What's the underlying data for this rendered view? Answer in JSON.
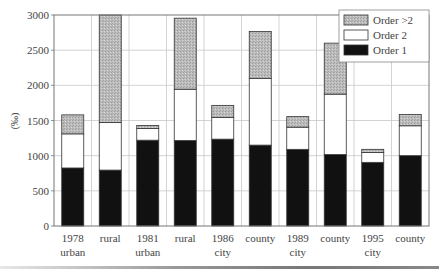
{
  "chart_data": {
    "type": "bar",
    "stacked": true,
    "title": "",
    "xlabel": "",
    "ylabel": "(‰)",
    "ylim": [
      0,
      3000
    ],
    "yticks": [
      0,
      500,
      1000,
      1500,
      2000,
      2500,
      3000
    ],
    "grid": true,
    "legend_position": "upper right (inside)",
    "categories": [
      {
        "line1": "1978",
        "line2": "urban"
      },
      {
        "line1": "rural",
        "line2": ""
      },
      {
        "line1": "1981",
        "line2": "urban"
      },
      {
        "line1": "rural",
        "line2": ""
      },
      {
        "line1": "1986",
        "line2": "city"
      },
      {
        "line1": "county",
        "line2": ""
      },
      {
        "line1": "1989",
        "line2": "city"
      },
      {
        "line1": "county",
        "line2": ""
      },
      {
        "line1": "1995",
        "line2": "city"
      },
      {
        "line1": "county",
        "line2": ""
      }
    ],
    "series": [
      {
        "name": "Order 1",
        "color": "#111111",
        "pattern": "solid",
        "values": [
          825,
          795,
          1220,
          1215,
          1235,
          1150,
          1090,
          1015,
          905,
          1000
        ]
      },
      {
        "name": "Order 2",
        "color": "#ffffff",
        "pattern": "solid",
        "values": [
          485,
          675,
          165,
          730,
          310,
          950,
          315,
          860,
          140,
          425
        ]
      },
      {
        "name": "Order >2",
        "color": "#b8b8b8",
        "pattern": "stipple",
        "values": [
          270,
          1530,
          45,
          1010,
          170,
          665,
          150,
          725,
          45,
          160
        ]
      }
    ],
    "totals": [
      1580,
      3000,
      1430,
      2955,
      1715,
      2765,
      1555,
      2600,
      1090,
      1585
    ],
    "legend": [
      "Order >2",
      "Order 2",
      "Order 1"
    ]
  }
}
